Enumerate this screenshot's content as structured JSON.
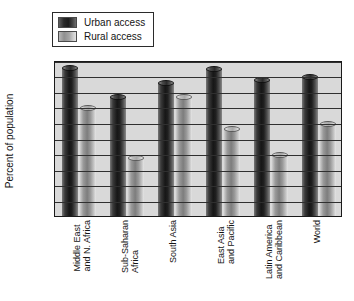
{
  "legend": {
    "items": [
      {
        "label": "Urban access",
        "swatch": "dark-gray",
        "color": "#1c1c1c"
      },
      {
        "label": "Rural access",
        "swatch": "light-gray",
        "color": "#a5a5a5"
      }
    ]
  },
  "axis": {
    "ylabel": "Percent of population",
    "yticks": [
      "0",
      "10",
      "20",
      "30",
      "40",
      "50",
      "60",
      "70",
      "80",
      "90",
      "100"
    ]
  },
  "chart_data": {
    "type": "bar",
    "title": "",
    "xlabel": "",
    "ylabel": "Percent of population",
    "ylim": [
      0,
      100
    ],
    "ytick_step": 10,
    "grid": true,
    "legend_position": "top-left",
    "categories": [
      "Middle East\nand N. Africa",
      "Sub-Saharan\nAfrica",
      "South Asia",
      "East Asia\nand Pacific",
      "Latin America\nand Caribbean",
      "World"
    ],
    "series": [
      {
        "name": "Urban access",
        "color": "#1c1c1c",
        "values": [
          97,
          78,
          87,
          96,
          89,
          91
        ]
      },
      {
        "name": "Rural access",
        "color": "#a5a5a5",
        "values": [
          71,
          39,
          78,
          58,
          41,
          61
        ]
      }
    ]
  }
}
